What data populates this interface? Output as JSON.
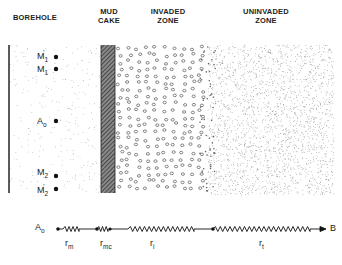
{
  "headers": {
    "borehole": "BOREHOLE",
    "mud_cake_line1": "MUD",
    "mud_cake_line2": "CAKE",
    "invaded_line1": "INVADED",
    "invaded_line2": "ZONE",
    "uninvaded_line1": "UNINVADED",
    "uninvaded_line2": "ZONE"
  },
  "electrodes": [
    {
      "id": "M1p",
      "base": "M",
      "sub": "1",
      "prime": true
    },
    {
      "id": "M1",
      "base": "M",
      "sub": "1",
      "prime": false
    },
    {
      "id": "A0",
      "base": "A",
      "sub": "o",
      "prime": false
    },
    {
      "id": "M2",
      "base": "M",
      "sub": "2",
      "prime": false
    },
    {
      "id": "M2p",
      "base": "M",
      "sub": "2",
      "prime": true
    }
  ],
  "circuit": {
    "start": {
      "base": "A",
      "sub": "o"
    },
    "end": "B",
    "resistors": [
      {
        "base": "r",
        "sub": "m"
      },
      {
        "base": "r",
        "sub": "mc"
      },
      {
        "base": "r",
        "sub": "i"
      },
      {
        "base": "r",
        "sub": "t"
      }
    ]
  }
}
